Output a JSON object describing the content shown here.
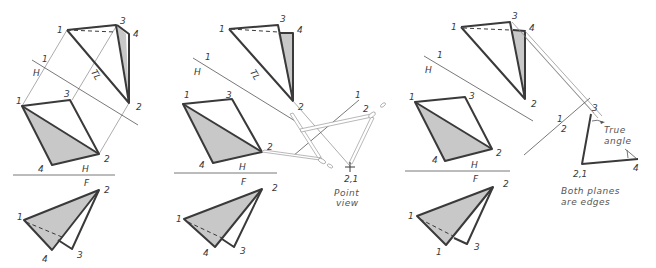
{
  "figure": {
    "colors": {
      "line": "#3a3a3a",
      "shade": "#c8c8c8",
      "projection": "#888888",
      "background": "#ffffff"
    },
    "panels": [
      {
        "id": "panel-1",
        "top_view": {
          "vertices": [
            "1",
            "3",
            "4",
            "2"
          ],
          "fold_labels": {
            "upper": "1",
            "lower": "H"
          },
          "tl_label": "TL"
        },
        "horizontal_view": {
          "vertices": [
            "1",
            "3",
            "2",
            "4"
          ],
          "fold_labels": {
            "upper": "H",
            "lower": "F"
          }
        },
        "front_view": {
          "vertices": [
            "1",
            "2",
            "4",
            "3"
          ]
        }
      },
      {
        "id": "panel-2",
        "top_view": {
          "vertices": [
            "1",
            "3",
            "4",
            "2"
          ],
          "fold_labels": {
            "upper": "1",
            "lower": "H"
          },
          "tl_label": "TL"
        },
        "horizontal_view": {
          "vertices": [
            "1",
            "3",
            "2",
            "4"
          ],
          "fold_labels": {
            "upper": "H",
            "lower": "F"
          }
        },
        "front_view": {
          "vertices": [
            "1",
            "2",
            "4",
            "3"
          ]
        },
        "aux_view": {
          "fold_labels": {
            "upper": "1",
            "lower": "2"
          },
          "point_label": "2,1",
          "note_line1": "Point",
          "note_line2": "view"
        }
      },
      {
        "id": "panel-3",
        "top_view": {
          "vertices": [
            "1",
            "3",
            "4",
            "2"
          ],
          "fold_labels": {
            "upper": "1",
            "lower": "H"
          }
        },
        "horizontal_view": {
          "vertices": [
            "1",
            "3",
            "2",
            "4"
          ],
          "fold_labels": {
            "upper": "H",
            "lower": "F"
          }
        },
        "front_view": {
          "vertices": [
            "1",
            "2",
            "1",
            "3"
          ]
        },
        "aux_view": {
          "fold_labels": {
            "upper": "1",
            "lower": "2"
          },
          "vertices": [
            "3",
            "2,1",
            "4"
          ],
          "angle_label_line1": "True",
          "angle_label_line2": "angle",
          "note_line1": "Both planes",
          "note_line2": "are edges"
        }
      }
    ]
  }
}
